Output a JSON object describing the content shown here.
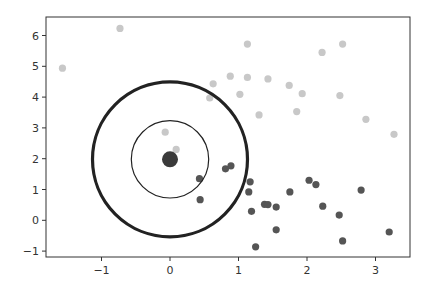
{
  "chart_data": {
    "type": "scatter",
    "title": "",
    "xlabel": "",
    "ylabel": "",
    "xlim": [
      -1.8,
      3.5
    ],
    "ylim": [
      -1.2,
      6.6
    ],
    "grid": false,
    "legend": null,
    "x_ticks": [
      -1,
      0,
      1,
      2,
      3
    ],
    "x_tick_labels": [
      "−1",
      "0",
      "1",
      "2",
      "3"
    ],
    "y_ticks": [
      -1,
      0,
      1,
      2,
      3,
      4,
      5,
      6
    ],
    "y_tick_labels": [
      "−1",
      "0",
      "1",
      "2",
      "3",
      "4",
      "5",
      "6"
    ],
    "series": [
      {
        "name": "light-points",
        "color": "#c8c8c8",
        "points": [
          [
            -1.57,
            4.94
          ],
          [
            -0.73,
            6.23
          ],
          [
            1.13,
            5.72
          ],
          [
            0.88,
            4.68
          ],
          [
            1.13,
            4.64
          ],
          [
            1.43,
            4.59
          ],
          [
            0.63,
            4.43
          ],
          [
            1.74,
            4.38
          ],
          [
            1.93,
            4.11
          ],
          [
            1.02,
            4.09
          ],
          [
            0.58,
            3.97
          ],
          [
            1.3,
            3.42
          ],
          [
            1.85,
            3.53
          ],
          [
            2.52,
            5.72
          ],
          [
            2.22,
            5.45
          ],
          [
            2.48,
            4.05
          ],
          [
            2.86,
            3.28
          ],
          [
            3.27,
            2.79
          ],
          [
            -0.07,
            2.86
          ],
          [
            0.09,
            2.3
          ]
        ]
      },
      {
        "name": "dark-points",
        "color": "#555555",
        "points": [
          [
            0.43,
            1.35
          ],
          [
            0.81,
            1.67
          ],
          [
            0.89,
            1.77
          ],
          [
            0.44,
            0.67
          ],
          [
            1.17,
            1.25
          ],
          [
            1.15,
            0.92
          ],
          [
            1.75,
            0.92
          ],
          [
            2.03,
            1.3
          ],
          [
            2.13,
            1.16
          ],
          [
            2.23,
            0.46
          ],
          [
            1.38,
            0.52
          ],
          [
            1.43,
            0.51
          ],
          [
            1.55,
            0.43
          ],
          [
            1.19,
            0.29
          ],
          [
            1.55,
            -0.31
          ],
          [
            1.25,
            -0.86
          ],
          [
            2.79,
            0.98
          ],
          [
            2.47,
            0.17
          ],
          [
            3.2,
            -0.38
          ],
          [
            2.52,
            -0.67
          ]
        ]
      },
      {
        "name": "query-point",
        "color": "#3a3a3a",
        "points": [
          [
            0.0,
            1.98
          ]
        ]
      }
    ],
    "annotations": [
      {
        "type": "circle",
        "center": [
          0.0,
          1.98
        ],
        "radius_px": 38.7,
        "stroke": "#222222",
        "stroke_width": 1.2,
        "label": "inner-radius"
      },
      {
        "type": "circle",
        "center": [
          0.0,
          1.98
        ],
        "radius_px": 77.5,
        "stroke": "#222222",
        "stroke_width": 3.2,
        "label": "outer-radius"
      }
    ]
  },
  "axes_frame": {
    "left": 46,
    "right": 410,
    "top": 17,
    "bottom": 257,
    "x_origin_px": 170,
    "x_px_per_unit": 68.5,
    "y_origin_px": 220.3,
    "y_px_per_unit": 30.8
  }
}
